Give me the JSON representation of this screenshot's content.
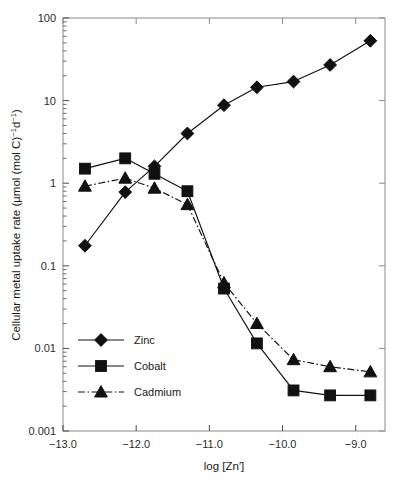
{
  "figure": {
    "background_color": "#ffffff",
    "ink_color": "#111111",
    "frame_color": "#8a8a8a"
  },
  "chart_data": {
    "type": "line",
    "title": "",
    "subtitle": "",
    "xlabel": "log [Zn′]",
    "ylabel": "Cellular metal uptake rate (µmol (mol C)⁻¹d⁻¹)",
    "ylabel_parts": {
      "lead": "Cellular metal uptake rate (µmol (mol C)",
      "sup1": "−1",
      "mid": "d",
      "sup2": "−1",
      "tail": ")"
    },
    "xscale": "linear",
    "yscale": "log",
    "xlim": [
      -13.0,
      -8.6
    ],
    "ylim": [
      0.001,
      100
    ],
    "grid": false,
    "legend_position": "lower-left-inside",
    "xticks": [
      -13.0,
      -12.0,
      -11.0,
      -10.0,
      -9.0
    ],
    "xticklabels": [
      "−13.0",
      "−12.0",
      "−11.0",
      "−10.0",
      "−9.0"
    ],
    "yticks": [
      0.001,
      0.01,
      0.1,
      1,
      10,
      100
    ],
    "yticklabels": [
      "0.001",
      "0.01",
      "0.1",
      "1",
      "10",
      "100"
    ],
    "minor_ticks": true,
    "tick_direction": "in",
    "series": [
      {
        "name": "Zinc",
        "marker": "diamond",
        "linestyle": "solid",
        "color": "#111111",
        "x": [
          -12.7,
          -12.15,
          -11.75,
          -11.3,
          -10.8,
          -10.35,
          -9.85,
          -9.35,
          -8.8
        ],
        "values": [
          0.175,
          0.78,
          1.6,
          4.0,
          8.8,
          14.5,
          17.0,
          27.0,
          53.0
        ]
      },
      {
        "name": "Cobalt",
        "marker": "square",
        "linestyle": "solid",
        "color": "#111111",
        "x": [
          -12.7,
          -12.15,
          -11.75,
          -11.3,
          -10.8,
          -10.35,
          -9.85,
          -9.35,
          -8.8
        ],
        "values": [
          1.5,
          2.0,
          1.3,
          0.8,
          0.053,
          0.0115,
          0.0031,
          0.0027,
          0.0027
        ]
      },
      {
        "name": "Cadmium",
        "marker": "triangle",
        "linestyle": "dashdot",
        "color": "#111111",
        "x": [
          -12.7,
          -12.15,
          -11.75,
          -11.3,
          -10.8,
          -10.35,
          -9.85,
          -9.35,
          -8.8
        ],
        "values": [
          0.92,
          1.15,
          0.87,
          0.55,
          0.062,
          0.02,
          0.0073,
          0.006,
          0.0052
        ]
      }
    ]
  },
  "legend": {
    "entries": [
      {
        "label": "Zinc"
      },
      {
        "label": "Cobalt"
      },
      {
        "label": "Cadmium"
      }
    ]
  }
}
